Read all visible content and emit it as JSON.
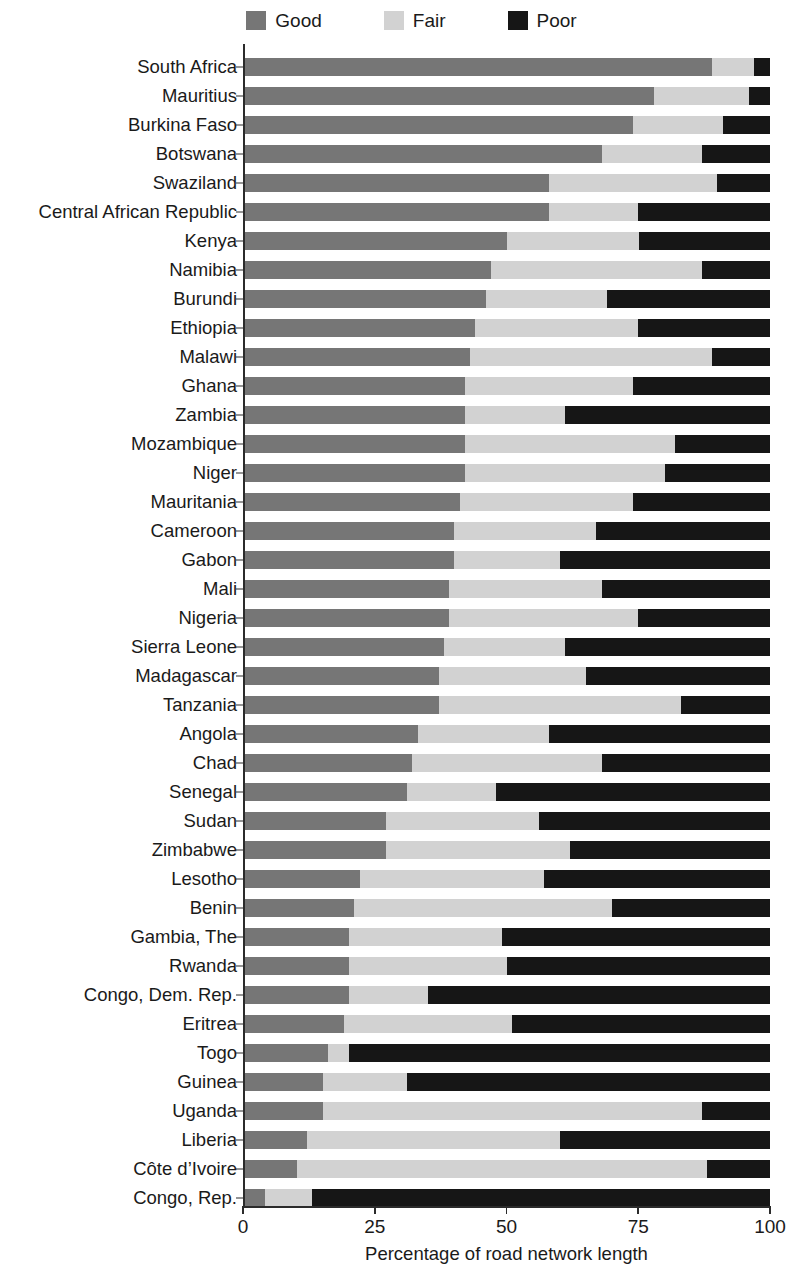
{
  "chart_data": {
    "type": "bar",
    "subtype": "horizontal-stacked-bar",
    "title": "",
    "xlabel": "Percentage of road network length",
    "ylabel": "",
    "xlim": [
      0,
      100
    ],
    "xticks": [
      0,
      25,
      50,
      75,
      100
    ],
    "xtick_labels": [
      "0",
      "25",
      "50",
      "75",
      "100"
    ],
    "grid": false,
    "legend_position": "top-center",
    "stacked_total": 100,
    "colors": {
      "Good": "#767676",
      "Fair": "#d2d2d2",
      "Poor": "#161616"
    },
    "series": [
      {
        "name": "Good",
        "values": [
          89,
          78,
          74,
          68,
          58,
          58,
          50,
          47,
          46,
          44,
          43,
          42,
          42,
          42,
          42,
          41,
          40,
          40,
          39,
          39,
          38,
          37,
          37,
          33,
          32,
          31,
          27,
          27,
          22,
          21,
          20,
          20,
          20,
          19,
          16,
          15,
          15,
          12,
          10,
          4
        ]
      },
      {
        "name": "Fair",
        "values": [
          8,
          18,
          17,
          19,
          32,
          17,
          25,
          40,
          23,
          31,
          46,
          32,
          19,
          40,
          38,
          33,
          27,
          20,
          29,
          36,
          23,
          28,
          46,
          25,
          36,
          17,
          29,
          35,
          35,
          49,
          29,
          30,
          15,
          32,
          4,
          16,
          72,
          48,
          78,
          9
        ]
      },
      {
        "name": "Poor",
        "values": [
          3,
          4,
          9,
          13,
          10,
          25,
          25,
          13,
          31,
          25,
          11,
          26,
          39,
          18,
          20,
          26,
          33,
          40,
          32,
          25,
          39,
          35,
          17,
          42,
          32,
          52,
          44,
          38,
          43,
          30,
          51,
          50,
          65,
          49,
          80,
          69,
          13,
          40,
          12,
          87
        ]
      }
    ],
    "categories": [
      "South Africa",
      "Mauritius",
      "Burkina Faso",
      "Botswana",
      "Swaziland",
      "Central African Republic",
      "Kenya",
      "Namibia",
      "Burundi",
      "Ethiopia",
      "Malawi",
      "Ghana",
      "Zambia",
      "Mozambique",
      "Niger",
      "Mauritania",
      "Cameroon",
      "Gabon",
      "Mali",
      "Nigeria",
      "Sierra Leone",
      "Madagascar",
      "Tanzania",
      "Angola",
      "Chad",
      "Senegal",
      "Sudan",
      "Zimbabwe",
      "Lesotho",
      "Benin",
      "Gambia, The",
      "Rwanda",
      "Congo, Dem. Rep.",
      "Eritrea",
      "Togo",
      "Guinea",
      "Uganda",
      "Liberia",
      "Côte d’Ivoire",
      "Congo, Rep."
    ]
  },
  "legend": {
    "items": [
      {
        "label": "Good",
        "color": "#767676",
        "swatch_name": "legend-swatch-good"
      },
      {
        "label": "Fair",
        "color": "#d2d2d2",
        "swatch_name": "legend-swatch-fair"
      },
      {
        "label": "Poor",
        "color": "#161616",
        "swatch_name": "legend-swatch-poor"
      }
    ]
  },
  "axis": {
    "x_title": "Percentage of road network length",
    "x_tick_labels": [
      "0",
      "25",
      "50",
      "75",
      "100"
    ]
  }
}
